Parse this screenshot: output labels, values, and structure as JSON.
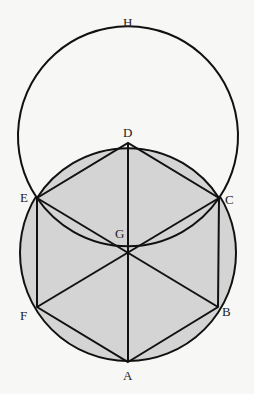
{
  "diagram": {
    "colors": {
      "fill": "#d4d4d4",
      "stroke": "#111111",
      "background": "#f7f7f6"
    },
    "labels": {
      "H": "H",
      "D": "D",
      "E": "E",
      "C": "C",
      "G": "G",
      "F": "F",
      "B": "B",
      "A": "A"
    },
    "points": {
      "A": [
        128,
        362
      ],
      "B": [
        218,
        307
      ],
      "C": [
        219,
        198
      ],
      "D": [
        128,
        143
      ],
      "E": [
        37,
        198
      ],
      "F": [
        37,
        307
      ],
      "G": [
        128,
        253
      ],
      "H": [
        128,
        33
      ]
    }
  }
}
